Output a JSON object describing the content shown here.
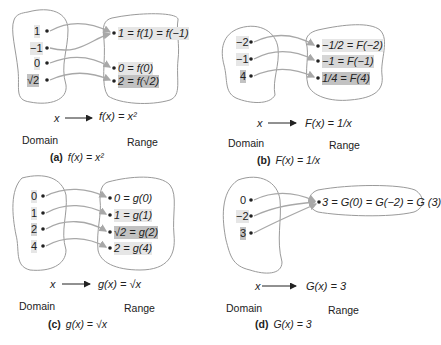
{
  "panels": [
    {
      "id": "a",
      "caption_letter": "(a)",
      "caption_formula": "f(x) = x²",
      "rule_x": "x",
      "rule_fx": "f(x) = x²",
      "domain_label": "Domain",
      "range_label": "Range",
      "domain": [
        "1",
        "−1",
        "0",
        "√2"
      ],
      "range": [
        "1 = f(1) = f(−1)",
        "0 = f(0)",
        "2 = f(√2)"
      ],
      "mapping": [
        [
          0,
          0
        ],
        [
          1,
          0
        ],
        [
          2,
          1
        ],
        [
          3,
          2
        ]
      ]
    },
    {
      "id": "b",
      "caption_letter": "(b)",
      "caption_formula": "F(x) = 1/x",
      "rule_x": "x",
      "rule_fx": "F(x) = 1/x",
      "domain_label": "Domain",
      "range_label": "Range",
      "domain": [
        "−2",
        "−1",
        "4"
      ],
      "range": [
        "−1/2 = F(−2)",
        "−1 = F(−1)",
        "1/4 = F(4)"
      ],
      "mapping": [
        [
          0,
          0
        ],
        [
          1,
          1
        ],
        [
          2,
          2
        ]
      ]
    },
    {
      "id": "c",
      "caption_letter": "(c)",
      "caption_formula": "g(x) = √x",
      "rule_x": "x",
      "rule_fx": "g(x) = √x",
      "domain_label": "Domain",
      "range_label": "Range",
      "domain": [
        "0",
        "1",
        "2",
        "4"
      ],
      "range": [
        "0 = g(0)",
        "1 = g(1)",
        "√2 = g(2)",
        "2 = g(4)"
      ],
      "mapping": [
        [
          0,
          0
        ],
        [
          1,
          1
        ],
        [
          2,
          2
        ],
        [
          3,
          3
        ]
      ]
    },
    {
      "id": "d",
      "caption_letter": "(d)",
      "caption_formula": "G(x) = 3",
      "rule_x": "x",
      "rule_fx": "G(x) = 3",
      "domain_label": "Domain",
      "range_label": "Range",
      "domain": [
        "0",
        "−2",
        "3"
      ],
      "range": [
        "3 = G(0) = G(−2) = G (3)"
      ],
      "mapping": [
        [
          0,
          0
        ],
        [
          1,
          0
        ],
        [
          2,
          0
        ]
      ]
    }
  ],
  "colors": {
    "blob_stroke": "#9a9a9a",
    "arrow": "#a8a8a8",
    "highlight_light": "#e6e6e6",
    "highlight_mid": "#d6d6d6",
    "highlight_dark": "#c2c2c2"
  }
}
